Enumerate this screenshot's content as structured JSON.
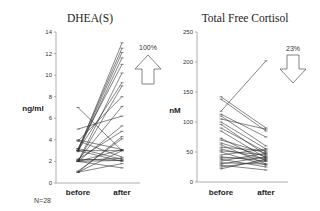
{
  "chart_data": [
    {
      "type": "line",
      "title": "DHEA(S)",
      "ylabel": "ng/ml",
      "xlabel": "",
      "categories": [
        "before",
        "after"
      ],
      "ylim": [
        0,
        14
      ],
      "yticks": [
        0,
        2,
        4,
        6,
        8,
        10,
        12,
        14
      ],
      "grid": false,
      "annotation": {
        "text": "100%",
        "arrow": "up"
      },
      "footnote": "N=28",
      "series": [
        {
          "name": "s1",
          "values": [
            3.0,
            13.0
          ]
        },
        {
          "name": "s2",
          "values": [
            3.1,
            12.5
          ]
        },
        {
          "name": "s3",
          "values": [
            3.0,
            12.1
          ]
        },
        {
          "name": "s4",
          "values": [
            2.9,
            11.6
          ]
        },
        {
          "name": "s5",
          "values": [
            3.2,
            11.0
          ]
        },
        {
          "name": "s6",
          "values": [
            2.0,
            10.2
          ]
        },
        {
          "name": "s7",
          "values": [
            3.0,
            9.3
          ]
        },
        {
          "name": "s8",
          "values": [
            2.0,
            9.0
          ]
        },
        {
          "name": "s9",
          "values": [
            3.9,
            8.0
          ]
        },
        {
          "name": "s10",
          "values": [
            2.1,
            7.1
          ]
        },
        {
          "name": "s11",
          "values": [
            5.0,
            6.2
          ]
        },
        {
          "name": "s12",
          "values": [
            2.0,
            5.3
          ]
        },
        {
          "name": "s13",
          "values": [
            2.2,
            4.8
          ]
        },
        {
          "name": "s14",
          "values": [
            1.0,
            4.3
          ]
        },
        {
          "name": "s15",
          "values": [
            1.1,
            4.1
          ]
        },
        {
          "name": "s16",
          "values": [
            7.0,
            3.0
          ]
        },
        {
          "name": "s17",
          "values": [
            4.0,
            3.1
          ]
        },
        {
          "name": "s18",
          "values": [
            3.0,
            3.0
          ]
        },
        {
          "name": "s19",
          "values": [
            2.0,
            3.1
          ]
        },
        {
          "name": "s20",
          "values": [
            3.2,
            2.2
          ]
        },
        {
          "name": "s21",
          "values": [
            2.0,
            2.1
          ]
        },
        {
          "name": "s22",
          "values": [
            3.0,
            2.0
          ]
        },
        {
          "name": "s23",
          "values": [
            2.1,
            2.3
          ]
        },
        {
          "name": "s24",
          "values": [
            1.0,
            1.8
          ]
        },
        {
          "name": "s25",
          "values": [
            3.9,
            2.4
          ]
        },
        {
          "name": "s26",
          "values": [
            2.0,
            1.4
          ]
        },
        {
          "name": "s27",
          "values": [
            1.0,
            3.0
          ]
        },
        {
          "name": "s28",
          "values": [
            2.2,
            2.1
          ]
        }
      ]
    },
    {
      "type": "line",
      "title": "Total Free Cortisol",
      "ylabel": "nM",
      "xlabel": "",
      "categories": [
        "before",
        "after"
      ],
      "ylim": [
        0,
        250
      ],
      "yticks": [
        0,
        50,
        100,
        150,
        200,
        250
      ],
      "grid": false,
      "annotation": {
        "text": "23%",
        "arrow": "down"
      },
      "series": [
        {
          "name": "s1",
          "values": [
            118,
            202
          ]
        },
        {
          "name": "s2",
          "values": [
            142,
            90
          ]
        },
        {
          "name": "s3",
          "values": [
            138,
            85
          ]
        },
        {
          "name": "s4",
          "values": [
            113,
            75
          ]
        },
        {
          "name": "s5",
          "values": [
            110,
            60
          ]
        },
        {
          "name": "s6",
          "values": [
            105,
            88
          ]
        },
        {
          "name": "s7",
          "values": [
            100,
            55
          ]
        },
        {
          "name": "s8",
          "values": [
            96,
            45
          ]
        },
        {
          "name": "s9",
          "values": [
            90,
            50
          ]
        },
        {
          "name": "s10",
          "values": [
            85,
            40
          ]
        },
        {
          "name": "s11",
          "values": [
            73,
            35
          ]
        },
        {
          "name": "s12",
          "values": [
            70,
            48
          ]
        },
        {
          "name": "s13",
          "values": [
            65,
            42
          ]
        },
        {
          "name": "s14",
          "values": [
            62,
            30
          ]
        },
        {
          "name": "s15",
          "values": [
            58,
            52
          ]
        },
        {
          "name": "s16",
          "values": [
            55,
            38
          ]
        },
        {
          "name": "s17",
          "values": [
            52,
            45
          ]
        },
        {
          "name": "s18",
          "values": [
            50,
            28
          ]
        },
        {
          "name": "s19",
          "values": [
            45,
            55
          ]
        },
        {
          "name": "s20",
          "values": [
            42,
            35
          ]
        },
        {
          "name": "s21",
          "values": [
            40,
            40
          ]
        },
        {
          "name": "s22",
          "values": [
            38,
            25
          ]
        },
        {
          "name": "s23",
          "values": [
            35,
            48
          ]
        },
        {
          "name": "s24",
          "values": [
            32,
            30
          ]
        },
        {
          "name": "s25",
          "values": [
            30,
            42
          ]
        },
        {
          "name": "s26",
          "values": [
            28,
            20
          ]
        },
        {
          "name": "s27",
          "values": [
            25,
            35
          ]
        },
        {
          "name": "s28",
          "values": [
            22,
            38
          ]
        }
      ]
    }
  ],
  "labels": {
    "left_title": "DHEA(S)",
    "left_ylabel": "ng/ml",
    "left_pct": "100%",
    "right_title": "Total Free Cortisol",
    "right_ylabel": "nM",
    "right_pct": "23%",
    "before": "before",
    "after": "after",
    "n_label": "N=28"
  }
}
